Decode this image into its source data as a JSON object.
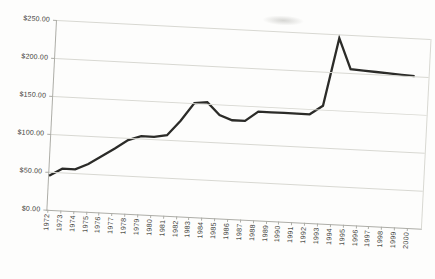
{
  "chart_data": {
    "type": "line",
    "title": "",
    "xlabel": "",
    "ylabel": "",
    "x": [
      1972,
      1973,
      1974,
      1975,
      1976,
      1977,
      1978,
      1979,
      1980,
      1981,
      1982,
      1983,
      1984,
      1985,
      1986,
      1987,
      1988,
      1989,
      1990,
      1991,
      1992,
      1993,
      1994,
      1995,
      1996,
      1997,
      1998,
      1999,
      2000
    ],
    "series": [
      {
        "name": "value",
        "values": [
          45,
          55,
          55,
          63,
          74,
          85,
          97,
          103,
          103,
          106,
          126,
          150,
          152,
          136,
          130,
          130,
          143,
          143,
          143,
          143,
          143,
          155,
          245,
          205,
          204,
          203,
          202,
          201,
          200
        ]
      }
    ],
    "y_ticks": [
      {
        "value": 0,
        "label": "$0.00"
      },
      {
        "value": 50,
        "label": "$50.00"
      },
      {
        "value": 100,
        "label": "$100.00"
      },
      {
        "value": 150,
        "label": "$150.00"
      },
      {
        "value": 200,
        "label": "$200.00"
      },
      {
        "value": 250,
        "label": "$250.00"
      }
    ],
    "ylim": [
      0,
      250
    ],
    "grid": true,
    "legend": false
  },
  "style": {
    "line_color": "#2b2b28",
    "grid_color": "#d8d8d2",
    "axis_color": "#adada7",
    "label_color": "#3e3e3a",
    "background_color": "#fdfdfc"
  }
}
